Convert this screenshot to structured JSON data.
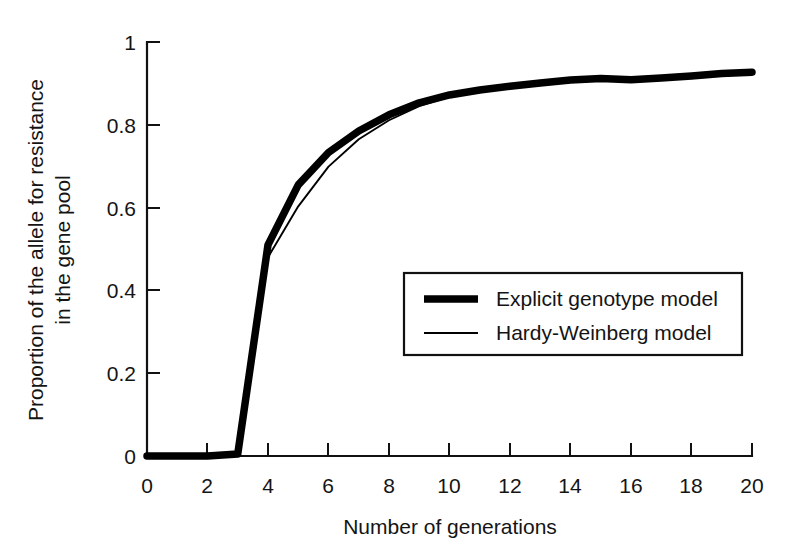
{
  "chart_data": {
    "type": "line",
    "title": "",
    "xlabel": "Number of generations",
    "ylabel": "Proportion of the allele for resistance in the gene pool",
    "ylabel_line1": "Proportion of the allele for resistance",
    "ylabel_line2": "in the gene pool",
    "xlim": [
      0,
      20
    ],
    "ylim": [
      0,
      1
    ],
    "grid": false,
    "legend_position": "center-right-inside",
    "xticks": [
      0,
      2,
      4,
      6,
      8,
      10,
      12,
      14,
      16,
      18,
      20
    ],
    "xtick_labels": [
      "0",
      "2",
      "4",
      "6",
      "8",
      "10",
      "12",
      "14",
      "16",
      "18",
      "20"
    ],
    "yticks": [
      0,
      0.2,
      0.4,
      0.6,
      0.8,
      1
    ],
    "ytick_labels": [
      "0",
      "0.2",
      "0.4",
      "0.6",
      "0.8",
      "1"
    ],
    "x": [
      0,
      1,
      2,
      3,
      4,
      5,
      6,
      7,
      8,
      9,
      10,
      11,
      12,
      13,
      14,
      15,
      16,
      17,
      18,
      19,
      20
    ],
    "series": [
      {
        "name": "Explicit genotype model",
        "line_style": "thick-solid",
        "color": "#000000",
        "values": [
          0,
          0,
          0,
          0.005,
          0.51,
          0.655,
          0.733,
          0.785,
          0.824,
          0.853,
          0.872,
          0.884,
          0.893,
          0.901,
          0.908,
          0.912,
          0.909,
          0.913,
          0.918,
          0.924,
          0.927
        ]
      },
      {
        "name": "Hardy-Weinberg model",
        "line_style": "thin-solid",
        "color": "#000000",
        "values": [
          0,
          0,
          0,
          0.005,
          0.48,
          0.603,
          0.699,
          0.765,
          0.811,
          0.845,
          0.868,
          0.882,
          0.892,
          0.9,
          0.907,
          0.911,
          0.909,
          0.913,
          0.918,
          0.924,
          0.927
        ]
      }
    ],
    "legend_entries": [
      {
        "label": "Explicit genotype model",
        "style": "thick-solid"
      },
      {
        "label": "Hardy-Weinberg model",
        "style": "thin-solid"
      }
    ]
  }
}
